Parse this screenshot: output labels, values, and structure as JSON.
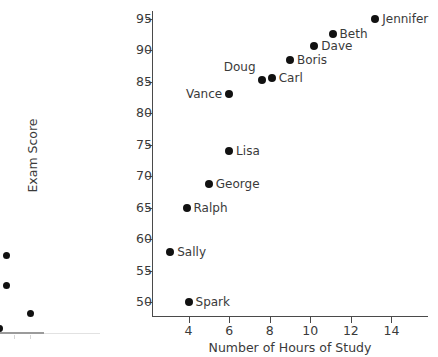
{
  "chart_data": {
    "type": "scatter",
    "title": "",
    "xlabel": "Number of Hours of Study",
    "ylabel": "Exam Score",
    "xlim": [
      2.2,
      15.8
    ],
    "ylim": [
      47.8,
      96.2
    ],
    "xticks": [
      4,
      6,
      8,
      10,
      12,
      14
    ],
    "yticks": [
      50,
      55,
      60,
      65,
      70,
      75,
      80,
      85,
      90,
      95
    ],
    "grid": false,
    "legend": null,
    "point_color": "#111111",
    "axis_color": "#4a4a4a",
    "points": [
      {
        "label": "Spark",
        "x": 4.0,
        "y": 50.0,
        "label_pos": "right"
      },
      {
        "label": "Sally",
        "x": 3.1,
        "y": 58.0,
        "label_pos": "right"
      },
      {
        "label": "Ralph",
        "x": 3.9,
        "y": 65.0,
        "label_pos": "right"
      },
      {
        "label": "George",
        "x": 5.0,
        "y": 68.7,
        "label_pos": "right"
      },
      {
        "label": "Lisa",
        "x": 6.0,
        "y": 74.0,
        "label_pos": "right"
      },
      {
        "label": "Vance",
        "x": 6.0,
        "y": 83.0,
        "label_pos": "left"
      },
      {
        "label": "Doug",
        "x": 7.6,
        "y": 85.2,
        "label_pos": "above-left"
      },
      {
        "label": "Carl",
        "x": 8.1,
        "y": 85.6,
        "label_pos": "right"
      },
      {
        "label": "Boris",
        "x": 9.0,
        "y": 88.5,
        "label_pos": "right"
      },
      {
        "label": "Dave",
        "x": 10.2,
        "y": 90.7,
        "label_pos": "right"
      },
      {
        "label": "Beth",
        "x": 11.1,
        "y": 92.5,
        "label_pos": "right"
      },
      {
        "label": "Jennifer",
        "x": 13.2,
        "y": 95.0,
        "label_pos": "right"
      }
    ]
  },
  "partial_chart": {
    "type": "scatter",
    "note": "cropped chart at left edge, partially visible",
    "points": [
      {
        "x_px": 6,
        "y_px": 15
      },
      {
        "x_px": 6,
        "y_px": 45
      },
      {
        "x_px": 30,
        "y_px": 73
      },
      {
        "x_px": -2,
        "y_px": 88
      }
    ],
    "ticks_px": [
      14,
      30
    ]
  }
}
